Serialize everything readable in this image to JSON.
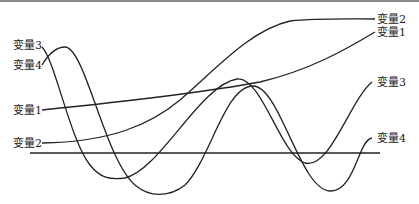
{
  "diagram": {
    "type": "multi-variable curves",
    "labels_left": [
      {
        "id": "var3",
        "text": "变量3"
      },
      {
        "id": "var4",
        "text": "变量4"
      },
      {
        "id": "var1",
        "text": "变量1"
      },
      {
        "id": "var2",
        "text": "变量2"
      }
    ],
    "labels_right": [
      {
        "id": "var2",
        "text": "变量2"
      },
      {
        "id": "var1",
        "text": "变量1"
      },
      {
        "id": "var3",
        "text": "变量3"
      },
      {
        "id": "var4",
        "text": "变量4"
      }
    ],
    "line_color": "#222222",
    "border_color": "#8a8a8a"
  }
}
